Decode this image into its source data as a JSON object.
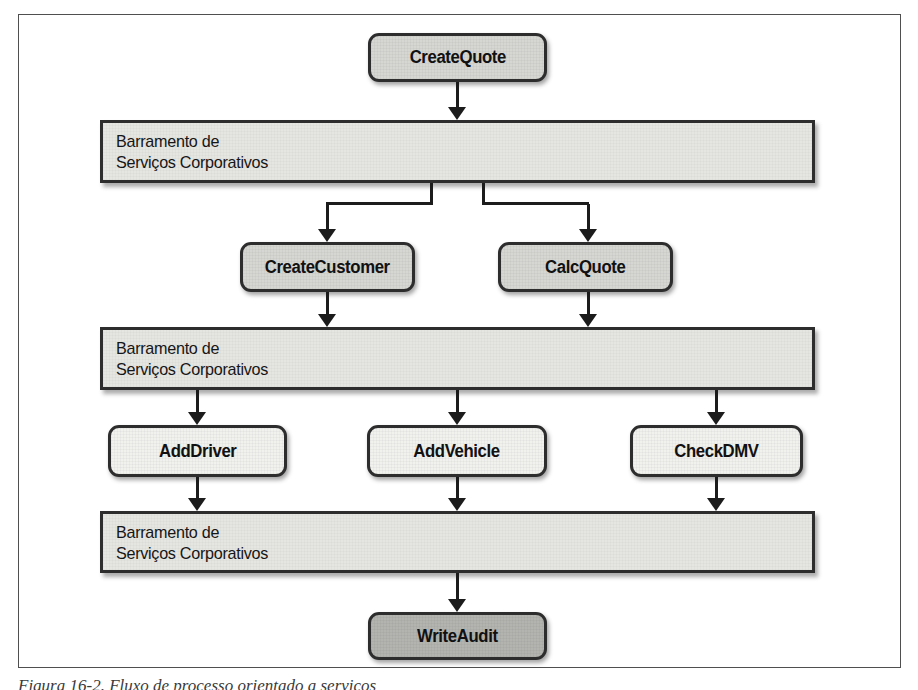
{
  "figure": {
    "caption": "Figura 16-2. Fluxo de processo orientado a serviços"
  },
  "bus_label": {
    "line1": "Barramento de",
    "line2": "Serviços Corporativos"
  },
  "nodes": {
    "create_quote": "CreateQuote",
    "create_customer": "CreateCustomer",
    "calc_quote": "CalcQuote",
    "add_driver": "AddDriver",
    "add_vehicle": "AddVehicle",
    "check_dmv": "CheckDMV",
    "write_audit": "WriteAudit"
  },
  "colors": {
    "node_fill_medium": "#d6d6d3",
    "node_fill_light": "#f1f1ee",
    "node_fill_dark": "#b3b3b0",
    "bus_fill": "#e5e5e2",
    "node_border": "#2d2d2d",
    "connector": "#1c1c1c",
    "frame_border": "#4f4f4f"
  }
}
